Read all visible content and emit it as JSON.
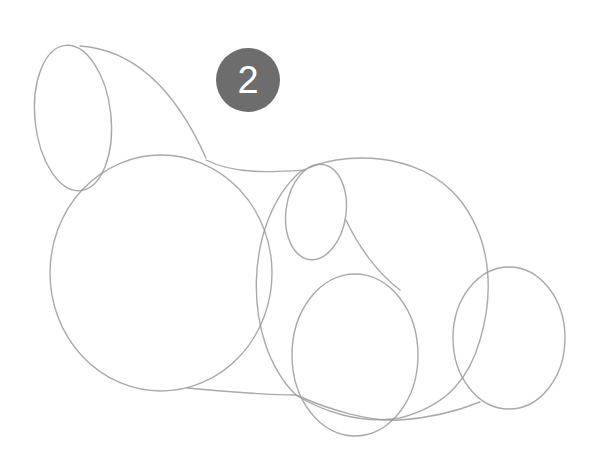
{
  "step": {
    "number": "2",
    "badge_color": "#6d6d6d",
    "text_color": "#ffffff"
  },
  "sketch": {
    "subject": "rabbit construction shapes",
    "stroke_color": "#9a9a9a",
    "shapes": [
      {
        "name": "ear",
        "cx": 73,
        "cy": 118,
        "rx": 38,
        "ry": 73
      },
      {
        "name": "head",
        "cx": 161,
        "cy": 273,
        "rx": 111,
        "ry": 118
      },
      {
        "name": "body",
        "cx": 370,
        "cy": 288,
        "rx": 120,
        "ry": 133
      },
      {
        "name": "front-leg",
        "cx": 316,
        "cy": 212,
        "rx": 31,
        "ry": 48
      },
      {
        "name": "hind-foot",
        "cx": 355,
        "cy": 355,
        "rx": 63,
        "ry": 81
      },
      {
        "name": "tail",
        "cx": 509,
        "cy": 338,
        "rx": 56,
        "ry": 71
      }
    ]
  }
}
